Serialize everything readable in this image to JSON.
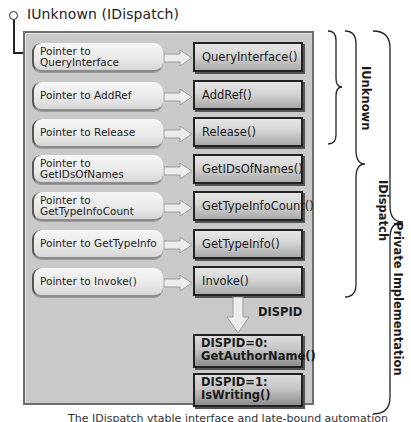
{
  "header": {
    "interface_title": "IUnknown (IDispatch)"
  },
  "vtable": {
    "pointers": [
      {
        "label_line1": "Pointer to QueryInterface",
        "label_line2": ""
      },
      {
        "label_line1": "Pointer to AddRef",
        "label_line2": ""
      },
      {
        "label_line1": "Pointer to Release",
        "label_line2": ""
      },
      {
        "label_line1": "Pointer to",
        "label_line2": "GetIDsOfNames"
      },
      {
        "label_line1": "Pointer to",
        "label_line2": "GetTypeInfoCount"
      },
      {
        "label_line1": "Pointer to GetTypeInfo",
        "label_line2": ""
      },
      {
        "label_line1": "Pointer to Invoke()",
        "label_line2": ""
      }
    ],
    "functions": [
      "QueryInterface()",
      "AddRef()",
      "Release()",
      "GetIDsOfNames()",
      "GetTypeInfoCount()",
      "GetTypeInfo()",
      "Invoke()"
    ]
  },
  "dispatch": {
    "arrow_label": "DISPID",
    "methods": [
      {
        "line1": "DISPID=0:",
        "line2": "GetAuthorName()"
      },
      {
        "line1": "DISPID=1:",
        "line2": "IsWriting()"
      }
    ]
  },
  "braces": {
    "iunknown": "IUnknown",
    "idispatch": "IDispatch",
    "private": "Private Implementation"
  },
  "colors": {
    "panel_bg": "#c9c9c9",
    "panel_border": "#6e6e6e",
    "function_border": "#222222",
    "arrow_fill": "#e8e8e8"
  },
  "caption": "The IDispatch vtable interface and late-bound automation"
}
